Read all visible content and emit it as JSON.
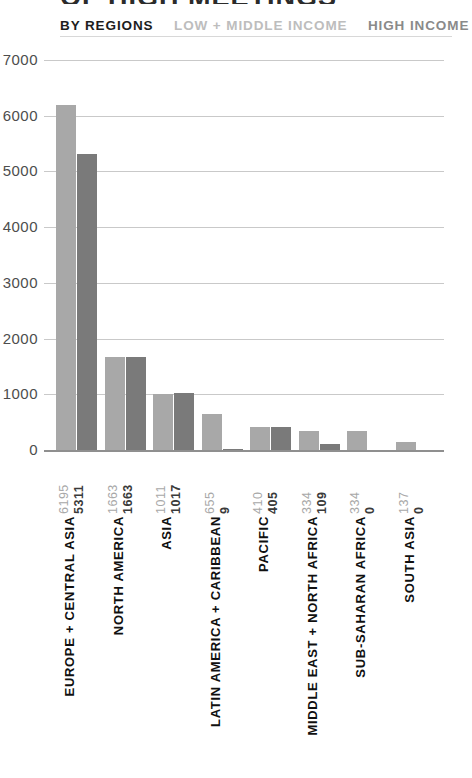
{
  "title": "OF HIGH MEETINGS",
  "legend": {
    "primary": "BY REGIONS",
    "series_low": "LOW + MIDDLE INCOME",
    "series_high": "HIGH INCOME"
  },
  "colors": {
    "low_income_bar": "#a8a8a8",
    "high_income_bar": "#7a7a7a",
    "gridline": "#c9c9c9",
    "axis": "#8f8f8f",
    "legend_primary": "#1d1d1d",
    "legend_low": "#bdbdbd",
    "legend_high": "#8a8a8a"
  },
  "chart_data": {
    "type": "bar",
    "title": "OF HIGH MEETINGS",
    "subtitle": "BY REGIONS",
    "xlabel": "",
    "ylabel": "",
    "ylim": [
      0,
      7000
    ],
    "grid": true,
    "legend_position": "top",
    "yticks": [
      7000,
      6000,
      5000,
      4000,
      3000,
      2000,
      1000,
      0
    ],
    "ytick_labels": [
      "7000",
      "6000",
      "5000",
      "4000",
      "3000",
      "2000",
      "1000",
      "0"
    ],
    "categories": [
      "EUROPE + CENTRAL ASIA",
      "NORTH AMERICA",
      "ASIA",
      "LATIN AMERICA + CARIBBEAN",
      "PACIFIC",
      "MIDDLE EAST + NORTH AFRICA",
      "SUB-SAHARAN AFRICA",
      "SOUTH ASIA"
    ],
    "series": [
      {
        "name": "LOW + MIDDLE INCOME",
        "color": "#a8a8a8",
        "values": [
          6195,
          1663,
          1011,
          655,
          410,
          334,
          334,
          137
        ]
      },
      {
        "name": "HIGH INCOME",
        "color": "#7a7a7a",
        "values": [
          5311,
          1663,
          1017,
          9,
          405,
          109,
          0,
          0
        ]
      }
    ]
  }
}
